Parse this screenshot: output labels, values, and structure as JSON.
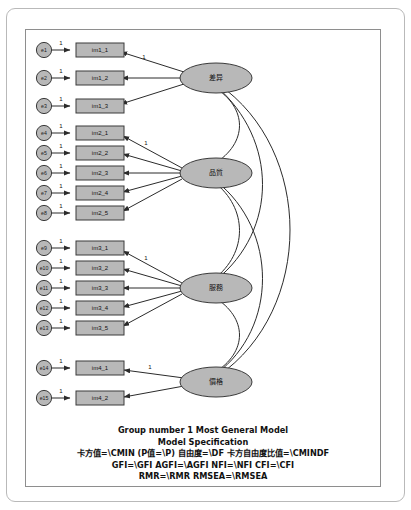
{
  "diagram": {
    "type": "sem-path-diagram",
    "title": "Most General Model",
    "errors": [
      {
        "id": "e1",
        "label": "e1"
      },
      {
        "id": "e2",
        "label": "e2"
      },
      {
        "id": "e3",
        "label": "e3"
      },
      {
        "id": "e4",
        "label": "e4"
      },
      {
        "id": "e5",
        "label": "e5"
      },
      {
        "id": "e6",
        "label": "e6"
      },
      {
        "id": "e7",
        "label": "e7"
      },
      {
        "id": "e8",
        "label": "e8"
      },
      {
        "id": "e9",
        "label": "e9"
      },
      {
        "id": "e10",
        "label": "e10"
      },
      {
        "id": "e11",
        "label": "e11"
      },
      {
        "id": "e12",
        "label": "e12"
      },
      {
        "id": "e13",
        "label": "e13"
      },
      {
        "id": "e14",
        "label": "e14"
      },
      {
        "id": "e15",
        "label": "e15"
      }
    ],
    "indicators": [
      {
        "id": "im1_1",
        "label": "im1_1"
      },
      {
        "id": "im1_2",
        "label": "im1_2"
      },
      {
        "id": "im1_3",
        "label": "im1_3"
      },
      {
        "id": "im2_1",
        "label": "im2_1"
      },
      {
        "id": "im2_2",
        "label": "im2_2"
      },
      {
        "id": "im2_3",
        "label": "im2_3"
      },
      {
        "id": "im2_4",
        "label": "im2_4"
      },
      {
        "id": "im2_5",
        "label": "im2_5"
      },
      {
        "id": "im3_1",
        "label": "im3_1"
      },
      {
        "id": "im3_2",
        "label": "im3_2"
      },
      {
        "id": "im3_3",
        "label": "im3_3"
      },
      {
        "id": "im3_4",
        "label": "im3_4"
      },
      {
        "id": "im3_5",
        "label": "im3_5"
      },
      {
        "id": "im4_1",
        "label": "im4_1"
      },
      {
        "id": "im4_2",
        "label": "im4_2"
      }
    ],
    "latents": [
      {
        "id": "f1",
        "label": "差异"
      },
      {
        "id": "f2",
        "label": "品質"
      },
      {
        "id": "f3",
        "label": "服務"
      },
      {
        "id": "f4",
        "label": "價格"
      }
    ],
    "fixed_loading_label": "1",
    "error_path_label": "1",
    "covariance_count": 6
  },
  "caption": {
    "line1": "Group number 1    Most General Model",
    "line2": "Model Specification",
    "line3": "卡方值=\\CMIN   (P值=\\P)  自由度=\\DF   卡方自由度比值=\\CMINDF",
    "line4": "GFI=\\GFI  AGFI=\\AGFI  NFI=\\NFI  CFI=\\CFI",
    "line5": "RMR=\\RMR  RMSEA=\\RMSEA"
  },
  "colors": {
    "node_fill": "#b8b8b8",
    "node_stroke": "#3a3a3a",
    "edge": "#2b2b2b",
    "frame": "#8e8e8e",
    "page_border": "#b9b9b9",
    "background": "#ffffff"
  }
}
